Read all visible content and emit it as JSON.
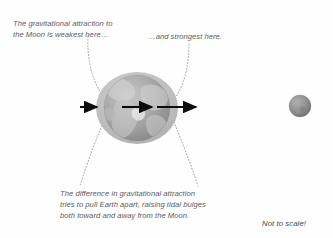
{
  "figure": {
    "background_color": "#fefefe",
    "text_color": "#5c5c5c"
  },
  "labels": {
    "weakest": "The gravitational attraction to\nthe Moon is weakest here…",
    "strongest": "…and strongest here.",
    "difference": "The difference in gravitational attraction\ntries to pull Earth apart, raising tidal bulges\nboth toward and away from the Moon.",
    "not_to_scale": "Not to scale!"
  },
  "objects": {
    "earth": {
      "name": "Earth",
      "center_x": 137,
      "center_y": 108,
      "radius": 33,
      "body_color": "#9a9a9a",
      "land_color": "#c3c3c3"
    },
    "tidal_bulge": {
      "name": "Tidal bulge envelope",
      "center_x": 137,
      "center_y": 108,
      "radius_x": 41,
      "radius_y": 36,
      "fill_color": "#bdbdbd"
    },
    "moon": {
      "name": "Moon",
      "center_x": 300,
      "center_y": 106,
      "radius": 11,
      "body_color": "#8f8f8f"
    }
  },
  "arrows": {
    "color": "#0d0d0d",
    "items": [
      {
        "name": "far-side-weakest-arrow",
        "label": "weakest attraction",
        "x1": 80,
        "x2": 98,
        "y": 107,
        "length": 18
      },
      {
        "name": "center-arrow",
        "label": "attraction at Earth's center",
        "x1": 122,
        "x2": 153,
        "y": 107,
        "length": 31
      },
      {
        "name": "near-side-strongest-arrow",
        "label": "strongest attraction",
        "x1": 157,
        "x2": 197,
        "y": 107,
        "length": 40
      }
    ]
  },
  "leader_lines": {
    "color": "#9e9e9e",
    "style": "dotted",
    "items": [
      {
        "name": "leader-weakest",
        "from": "weakest label",
        "to": "far side of Earth"
      },
      {
        "name": "leader-strongest",
        "from": "strongest label",
        "to": "near side of Earth"
      },
      {
        "name": "leader-bulge-left",
        "from": "difference label",
        "to": "left tidal bulge"
      },
      {
        "name": "leader-bulge-right",
        "from": "difference label",
        "to": "right tidal bulge"
      }
    ]
  }
}
